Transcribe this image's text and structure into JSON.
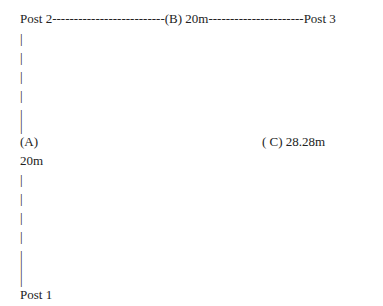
{
  "diagram": {
    "top_line": "Post 2--------------------------(B) 20m----------------------Post 3",
    "upper_bars": [
      "|",
      "|",
      "|",
      "|",
      "|",
      "|"
    ],
    "label_a": "(A)",
    "label_c": "( C) 28.28m",
    "label_a_length": "20m",
    "lower_bars": [
      "|",
      "|",
      "|",
      "|",
      "|",
      "|",
      "|"
    ],
    "bottom_label": "Post 1",
    "posts": [
      "Post 1",
      "Post 2",
      "Post 3"
    ],
    "segments": [
      {
        "name": "(A)",
        "from": "Post 1",
        "to": "Post 2",
        "length": "20m"
      },
      {
        "name": "(B)",
        "from": "Post 2",
        "to": "Post 3",
        "length": "20m"
      },
      {
        "name": "(C)",
        "from": "Post 1",
        "to": "Post 3",
        "length": "28.28m"
      }
    ]
  }
}
